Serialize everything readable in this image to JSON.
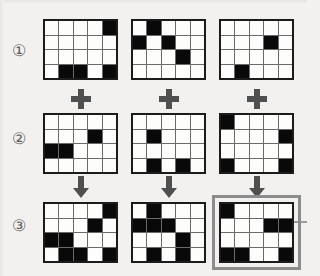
{
  "puzzle": {
    "title": "Grid overlay logic puzzle",
    "grid_columns": 5,
    "grid_rows": 4,
    "cell_on_color": "#090909",
    "cell_off_color": "#fdfdfb",
    "grid_line_color": "#6a6a6a",
    "grid_border_color": "#1b1b1b",
    "background_color": "#f2f1ef",
    "answer_outline_color": "#8c8c8c"
  },
  "row_labels": [
    {
      "name": "row-1-label",
      "text": "①"
    },
    {
      "name": "row-2-label",
      "text": "②"
    },
    {
      "name": "row-3-label",
      "text": "③"
    }
  ],
  "operators": {
    "plus_label": "+",
    "arrow_label": "↓",
    "plus_row": [
      {
        "name": "plus-column-1",
        "text": "+"
      },
      {
        "name": "plus-column-2",
        "text": "+"
      },
      {
        "name": "plus-column-3",
        "text": "+"
      }
    ],
    "arrow_row": [
      {
        "name": "arrow-column-1",
        "text": "↓"
      },
      {
        "name": "arrow-column-2",
        "text": "↓"
      },
      {
        "name": "arrow-column-3",
        "text": "↓"
      }
    ]
  },
  "grids": {
    "row1": [
      {
        "id": "grid-1-1",
        "cells": [
          [
            0,
            0,
            0,
            0,
            1
          ],
          [
            0,
            0,
            0,
            0,
            0
          ],
          [
            0,
            0,
            0,
            0,
            0
          ],
          [
            0,
            1,
            1,
            0,
            1
          ]
        ]
      },
      {
        "id": "grid-1-2",
        "cells": [
          [
            0,
            1,
            0,
            0,
            0
          ],
          [
            1,
            0,
            1,
            0,
            0
          ],
          [
            0,
            0,
            0,
            1,
            0
          ],
          [
            0,
            0,
            0,
            0,
            0
          ]
        ]
      },
      {
        "id": "grid-1-3",
        "cells": [
          [
            0,
            0,
            0,
            0,
            0
          ],
          [
            0,
            0,
            0,
            1,
            0
          ],
          [
            0,
            0,
            0,
            0,
            0
          ],
          [
            0,
            1,
            0,
            0,
            0
          ]
        ]
      }
    ],
    "row2": [
      {
        "id": "grid-2-1",
        "cells": [
          [
            0,
            0,
            0,
            0,
            0
          ],
          [
            0,
            0,
            0,
            1,
            0
          ],
          [
            1,
            1,
            0,
            0,
            0
          ],
          [
            0,
            0,
            0,
            0,
            0
          ]
        ]
      },
      {
        "id": "grid-2-2",
        "cells": [
          [
            0,
            0,
            0,
            0,
            0
          ],
          [
            0,
            1,
            0,
            0,
            0
          ],
          [
            0,
            0,
            0,
            0,
            0
          ],
          [
            0,
            1,
            0,
            1,
            0
          ]
        ]
      },
      {
        "id": "grid-2-3",
        "cells": [
          [
            1,
            0,
            0,
            0,
            0
          ],
          [
            0,
            0,
            0,
            0,
            1
          ],
          [
            0,
            0,
            0,
            0,
            0
          ],
          [
            1,
            0,
            0,
            0,
            1
          ]
        ]
      }
    ],
    "row3": [
      {
        "id": "grid-3-1",
        "highlighted": false,
        "cells": [
          [
            0,
            0,
            0,
            0,
            1
          ],
          [
            0,
            0,
            0,
            1,
            0
          ],
          [
            1,
            1,
            0,
            0,
            0
          ],
          [
            0,
            1,
            1,
            0,
            1
          ]
        ]
      },
      {
        "id": "grid-3-2",
        "highlighted": false,
        "cells": [
          [
            0,
            1,
            0,
            0,
            0
          ],
          [
            1,
            1,
            1,
            0,
            0
          ],
          [
            0,
            0,
            0,
            1,
            0
          ],
          [
            0,
            1,
            0,
            1,
            0
          ]
        ]
      },
      {
        "id": "grid-3-3",
        "highlighted": true,
        "cells": [
          [
            1,
            0,
            0,
            0,
            0
          ],
          [
            0,
            0,
            0,
            1,
            1
          ],
          [
            0,
            0,
            0,
            0,
            0
          ],
          [
            1,
            1,
            0,
            0,
            1
          ]
        ]
      }
    ]
  }
}
